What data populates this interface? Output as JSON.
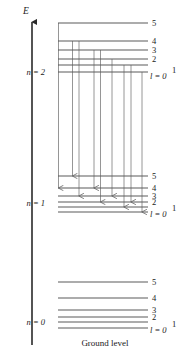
{
  "figure": {
    "axis_label": "E",
    "caption": "Ground level",
    "sublevel_labels": [
      "5",
      "4",
      "3",
      "2",
      "1",
      "0"
    ],
    "l_label": "l = 0",
    "l_superscript": "1"
  },
  "groups": [
    {
      "id": "n2",
      "label": "n = 2",
      "label_x": 45,
      "label_y": 75,
      "right_label_x": 152,
      "levels": [
        {
          "sublevel": "5",
          "y": 23,
          "x_left": 58,
          "x_right": 148,
          "label": "5",
          "label_y": 26
        },
        {
          "sublevel": "4",
          "y": 41,
          "x_left": 58,
          "x_right": 148,
          "label": "4",
          "label_y": 44
        },
        {
          "sublevel": "3",
          "y": 50,
          "x_left": 58,
          "x_right": 148,
          "label": "3",
          "label_y": 53
        },
        {
          "sublevel": "2",
          "y": 59,
          "x_left": 58,
          "x_right": 148,
          "label": "2",
          "label_y": 62
        },
        {
          "sublevel": "1",
          "y": 65,
          "x_left": 58,
          "x_right": 148,
          "label": "",
          "label_y": 68
        },
        {
          "sublevel": "0",
          "y": 72,
          "x_left": 58,
          "x_right": 148,
          "label": "",
          "label_y": 75
        }
      ],
      "l_label_x": 150,
      "l_label_y": 79,
      "l_sup_x": 172,
      "l_sup_y": 73
    },
    {
      "id": "n1",
      "label": "n = 1",
      "label_x": 45,
      "label_y": 206,
      "right_label_x": 152,
      "levels": [
        {
          "sublevel": "5",
          "y": 176,
          "x_left": 58,
          "x_right": 148,
          "label": "5",
          "label_y": 179
        },
        {
          "sublevel": "4",
          "y": 188,
          "x_left": 58,
          "x_right": 148,
          "label": "4",
          "label_y": 191
        },
        {
          "sublevel": "3",
          "y": 196,
          "x_left": 58,
          "x_right": 148,
          "label": "3",
          "label_y": 199
        },
        {
          "sublevel": "2",
          "y": 202,
          "x_left": 58,
          "x_right": 148,
          "label": "2",
          "label_y": 205
        },
        {
          "sublevel": "1",
          "y": 207,
          "x_left": 58,
          "x_right": 148,
          "label": "",
          "label_y": 210
        },
        {
          "sublevel": "0",
          "y": 212,
          "x_left": 58,
          "x_right": 148,
          "label": "",
          "label_y": 215
        }
      ],
      "l_label_x": 150,
      "l_label_y": 217,
      "l_sup_x": 172,
      "l_sup_y": 211
    },
    {
      "id": "n0",
      "label": "n = 0",
      "label_x": 45,
      "label_y": 325,
      "right_label_x": 152,
      "levels": [
        {
          "sublevel": "5",
          "y": 282,
          "x_left": 58,
          "x_right": 148,
          "label": "5",
          "label_y": 285
        },
        {
          "sublevel": "4",
          "y": 298,
          "x_left": 58,
          "x_right": 148,
          "label": "4",
          "label_y": 301
        },
        {
          "sublevel": "3",
          "y": 310,
          "x_left": 58,
          "x_right": 148,
          "label": "3",
          "label_y": 313
        },
        {
          "sublevel": "2",
          "y": 317,
          "x_left": 58,
          "x_right": 148,
          "label": "2",
          "label_y": 320
        },
        {
          "sublevel": "1",
          "y": 322,
          "x_left": 58,
          "x_right": 148,
          "label": "",
          "label_y": 325
        },
        {
          "sublevel": "0",
          "y": 328,
          "x_left": 58,
          "x_right": 148,
          "label": "",
          "label_y": 331
        }
      ],
      "l_label_x": 150,
      "l_label_y": 333,
      "l_sup_x": 172,
      "l_sup_y": 327
    }
  ],
  "transitions": [
    {
      "name": "t1",
      "x": 58.5,
      "y_start": 23,
      "y_end": 188
    },
    {
      "name": "t2",
      "x": 72.5,
      "y_start": 41,
      "y_end": 176
    },
    {
      "name": "t3",
      "x": 79,
      "y_start": 41,
      "y_end": 196
    },
    {
      "name": "t4",
      "x": 94,
      "y_start": 50,
      "y_end": 188
    },
    {
      "name": "t5",
      "x": 100.5,
      "y_start": 50,
      "y_end": 202
    },
    {
      "name": "t6",
      "x": 112,
      "y_start": 59,
      "y_end": 196
    },
    {
      "name": "t7",
      "x": 124,
      "y_start": 65,
      "y_end": 207
    },
    {
      "name": "t8",
      "x": 131,
      "y_start": 65,
      "y_end": 202
    },
    {
      "name": "t9",
      "x": 142,
      "y_start": 72,
      "y_end": 212
    }
  ],
  "axis": {
    "x": 32,
    "y_top": 22,
    "y_bottom": 345,
    "label_x": 26,
    "label_y": 14
  },
  "caption_pos": {
    "x": 105,
    "y": 346
  },
  "colors": {
    "level_line": "#5a5a5a",
    "transition_line": "#8a8a8a",
    "axis": "#2a2a2a",
    "text": "#1a1a1a",
    "background": "#ffffff"
  }
}
